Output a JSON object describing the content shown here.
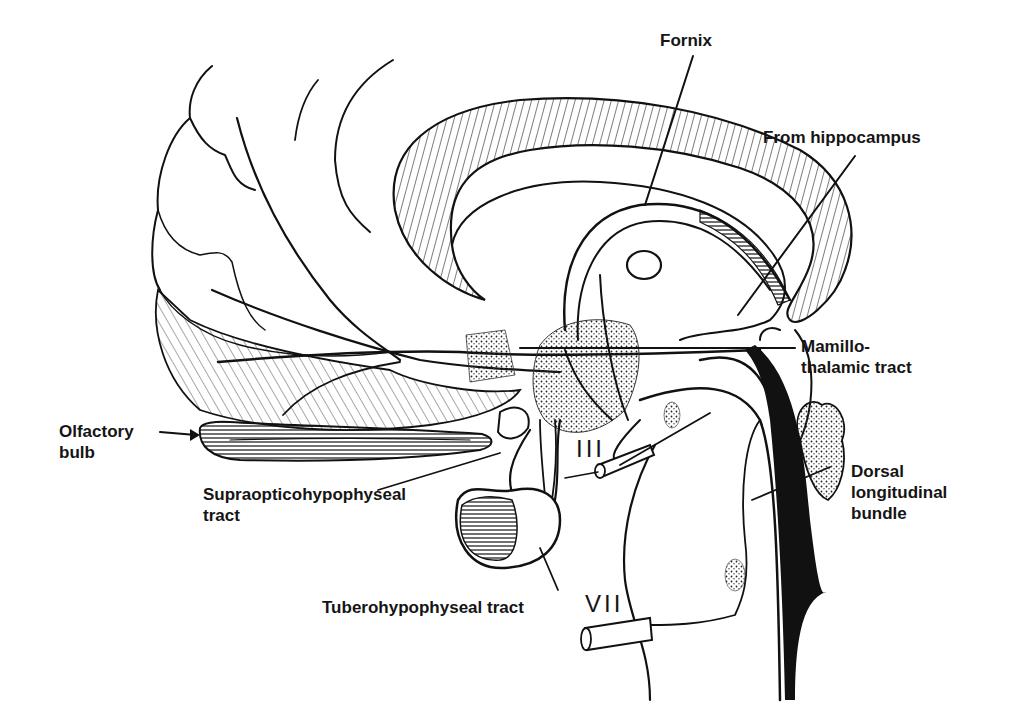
{
  "figure": {
    "type": "anatomical line drawing",
    "colors": {
      "ink": "#111111",
      "background": "#ffffff"
    }
  },
  "labels": {
    "fornix": "Fornix",
    "from_hippocampus": "From hippocampus",
    "mamillothalamic_line1": "Mamillo-",
    "mamillothalamic_line2": "thalamic tract",
    "olfactory_line1": "Olfactory",
    "olfactory_line2": "bulb",
    "supraoptic_line1": "Supraopticohypophyseal",
    "supraoptic_line2": "tract",
    "tuberohypophyseal": "Tuberohypophyseal tract",
    "dorsal_line1": "Dorsal",
    "dorsal_line2": "longitudinal",
    "dorsal_line3": "bundle"
  },
  "cranial_nerves": {
    "third": "III",
    "seventh": "VII"
  }
}
